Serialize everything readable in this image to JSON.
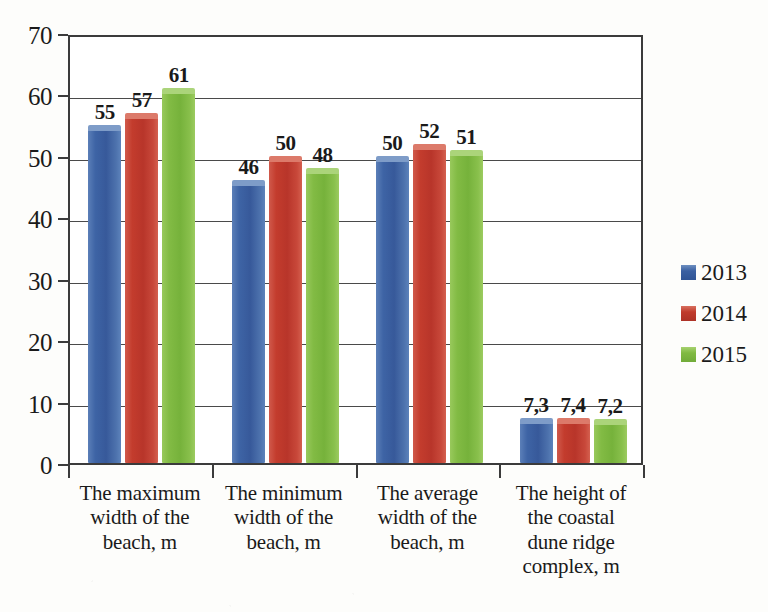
{
  "chart_data": {
    "type": "bar",
    "title": "",
    "xlabel": "",
    "ylabel": "",
    "ylim": [
      0,
      70
    ],
    "ytick_step": 10,
    "yticks": [
      "0",
      "10",
      "20",
      "30",
      "40",
      "50",
      "60",
      "70"
    ],
    "grid": true,
    "legend_position": "right",
    "decimal_separator": ",",
    "categories": [
      "The maximum width of the beach, m",
      "The minimum width of the beach, m",
      "The average width of the beach, m",
      "The height of the coastal dune ridge complex, m"
    ],
    "category_lines": [
      [
        "The maximum",
        "width of the",
        "beach, m"
      ],
      [
        "The minimum",
        "width of the",
        "beach, m"
      ],
      [
        "The average",
        "width of the",
        "beach, m"
      ],
      [
        "The height of",
        "the coastal",
        "dune ridge",
        "complex, m"
      ]
    ],
    "series": [
      {
        "name": "2013",
        "color": "#3a60a2",
        "values": [
          55,
          46,
          50,
          7.3
        ],
        "labels": [
          "55",
          "46",
          "50",
          "7,3"
        ]
      },
      {
        "name": "2014",
        "color": "#c03b2c",
        "values": [
          57,
          50,
          52,
          7.4
        ],
        "labels": [
          "57",
          "50",
          "52",
          "7,4"
        ]
      },
      {
        "name": "2015",
        "color": "#80ba42",
        "values": [
          61,
          48,
          51,
          7.2
        ],
        "labels": [
          "61",
          "48",
          "51",
          "7,2"
        ]
      }
    ]
  },
  "legend": {
    "entries": [
      {
        "label": "2013",
        "color": "#3a60a2"
      },
      {
        "label": "2014",
        "color": "#c03b2c"
      },
      {
        "label": "2015",
        "color": "#80ba42"
      }
    ]
  }
}
